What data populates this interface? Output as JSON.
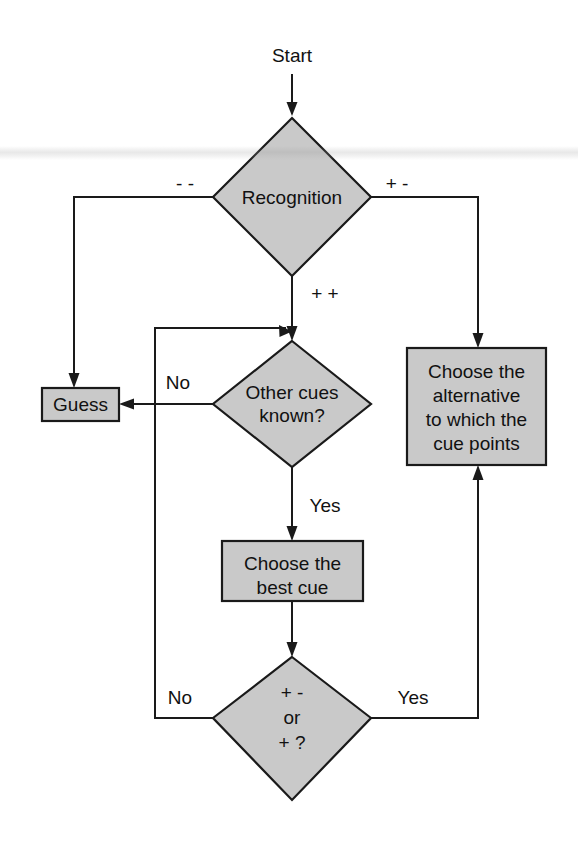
{
  "diagram": {
    "title_text": "Start",
    "type": "flowchart",
    "canvas": {
      "width": 578,
      "height": 861
    },
    "colors": {
      "shape_fill": "#c9c9c9",
      "shape_stroke": "#1a1a1a",
      "connector": "#1a1a1a",
      "text": "#111111",
      "background": "#ffffff"
    },
    "nodes": [
      {
        "id": "start",
        "kind": "terminator-label",
        "label": "Start",
        "lines": [
          "Start"
        ]
      },
      {
        "id": "recognition",
        "kind": "decision",
        "label": "Recognition",
        "lines": [
          "Recognition"
        ]
      },
      {
        "id": "guess",
        "kind": "process",
        "label": "Guess",
        "lines": [
          "Guess"
        ]
      },
      {
        "id": "other-cues",
        "kind": "decision",
        "label": "Other cues known?",
        "lines": [
          "Other cues",
          "known?"
        ]
      },
      {
        "id": "choose-alternative",
        "kind": "process",
        "label": "Choose the alternative to which the cue points",
        "lines": [
          "Choose the",
          "alternative",
          "to which the",
          "cue points"
        ]
      },
      {
        "id": "choose-best-cue",
        "kind": "process",
        "label": "Choose the best cue",
        "lines": [
          "Choose the",
          "best cue"
        ]
      },
      {
        "id": "cue-validity",
        "kind": "decision",
        "label": "+ - or + ?",
        "lines": [
          "+ -",
          "or",
          "+ ?"
        ]
      }
    ],
    "edges": [
      {
        "id": "start-to-recognition",
        "from": "start",
        "to": "recognition",
        "label": ""
      },
      {
        "id": "recognition-negative",
        "from": "recognition",
        "to": "guess",
        "label": "- -"
      },
      {
        "id": "recognition-positive-negative",
        "from": "recognition",
        "to": "choose-alternative",
        "label": "+ -"
      },
      {
        "id": "recognition-both-positive",
        "from": "recognition",
        "to": "other-cues",
        "label": "+ +"
      },
      {
        "id": "other-cues-no",
        "from": "other-cues",
        "to": "guess",
        "label": "No"
      },
      {
        "id": "other-cues-yes",
        "from": "other-cues",
        "to": "choose-best-cue",
        "label": "Yes"
      },
      {
        "id": "best-cue-to-validity",
        "from": "choose-best-cue",
        "to": "cue-validity",
        "label": ""
      },
      {
        "id": "validity-no",
        "from": "cue-validity",
        "to": "other-cues",
        "label": "No"
      },
      {
        "id": "validity-yes",
        "from": "cue-validity",
        "to": "choose-alternative",
        "label": "Yes"
      }
    ],
    "edge_labels": {
      "recognition_left": "- -",
      "recognition_right": "+ -",
      "recognition_down": "+ +",
      "other_cues_no": "No",
      "other_cues_yes": "Yes",
      "validity_no": "No",
      "validity_yes": "Yes"
    }
  }
}
